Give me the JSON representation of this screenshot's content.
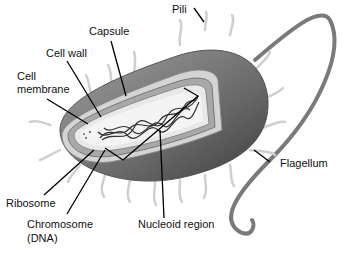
{
  "diagram": {
    "labels": {
      "pili": "Pili",
      "capsule": "Capsule",
      "cell_wall": "Cell wall",
      "cell_membrane_line1": "Cell",
      "cell_membrane_line2": "membrane",
      "flagellum": "Flagellum",
      "ribosome": "Ribosome",
      "chromosome_line1": "Chromosome",
      "chromosome_line2": "(DNA)",
      "nucleoid_region": "Nucleoid region"
    },
    "colors": {
      "body_dark": "#4a4a4a",
      "body_mid": "#8a8a8a",
      "capsule": "#cfcfcf",
      "wall": "#a8a8a8",
      "membrane": "#e6e6e6",
      "cytoplasm": "#f2f2f2",
      "dna": "#333333",
      "leader": "#000000"
    }
  }
}
